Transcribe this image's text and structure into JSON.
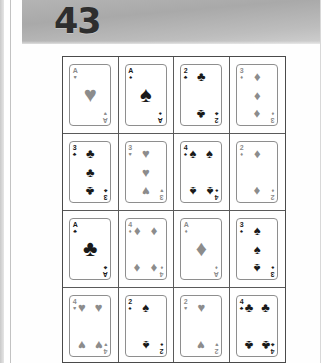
{
  "document": {
    "page_number": "43",
    "suit_glyphs": {
      "hearts": "♥",
      "spades": "♠",
      "clubs": "♣",
      "diamonds": "♦"
    },
    "colors": {
      "red_suit": "#8c8c8c",
      "black_suit": "#1a1a1a",
      "header_band": "#b4b4b4",
      "grid_border": "#4a4a4a",
      "card_border": "#8e8e8e",
      "page_background": "#ffffff"
    },
    "grid": {
      "columns": 4,
      "rows": 4,
      "cards": [
        {
          "rank": "A",
          "suit": "hearts",
          "color": "red",
          "pip_count": 1,
          "label": "Ace of Hearts"
        },
        {
          "rank": "A",
          "suit": "spades",
          "color": "black",
          "pip_count": 1,
          "label": "Ace of Spades"
        },
        {
          "rank": "2",
          "suit": "clubs",
          "color": "black",
          "pip_count": 2,
          "label": "Two of Clubs"
        },
        {
          "rank": "3",
          "suit": "diamonds",
          "color": "red",
          "pip_count": 3,
          "label": "Three of Diamonds"
        },
        {
          "rank": "3",
          "suit": "clubs",
          "color": "black",
          "pip_count": 3,
          "label": "Three of Clubs"
        },
        {
          "rank": "3",
          "suit": "hearts",
          "color": "red",
          "pip_count": 3,
          "label": "Three of Hearts"
        },
        {
          "rank": "4",
          "suit": "spades",
          "color": "black",
          "pip_count": 4,
          "label": "Four of Spades"
        },
        {
          "rank": "2",
          "suit": "diamonds",
          "color": "red",
          "pip_count": 2,
          "label": "Two of Diamonds"
        },
        {
          "rank": "A",
          "suit": "clubs",
          "color": "black",
          "pip_count": 1,
          "label": "Ace of Clubs"
        },
        {
          "rank": "4",
          "suit": "diamonds",
          "color": "red",
          "pip_count": 4,
          "label": "Four of Diamonds"
        },
        {
          "rank": "A",
          "suit": "diamonds",
          "color": "red",
          "pip_count": 1,
          "label": "Ace of Diamonds"
        },
        {
          "rank": "3",
          "suit": "spades",
          "color": "black",
          "pip_count": 3,
          "label": "Three of Spades"
        },
        {
          "rank": "4",
          "suit": "hearts",
          "color": "red",
          "pip_count": 4,
          "label": "Four of Hearts"
        },
        {
          "rank": "2",
          "suit": "spades",
          "color": "black",
          "pip_count": 2,
          "label": "Two of Spades"
        },
        {
          "rank": "2",
          "suit": "hearts",
          "color": "red",
          "pip_count": 2,
          "label": "Two of Hearts"
        },
        {
          "rank": "4",
          "suit": "clubs",
          "color": "black",
          "pip_count": 4,
          "label": "Four of Clubs"
        }
      ]
    }
  }
}
